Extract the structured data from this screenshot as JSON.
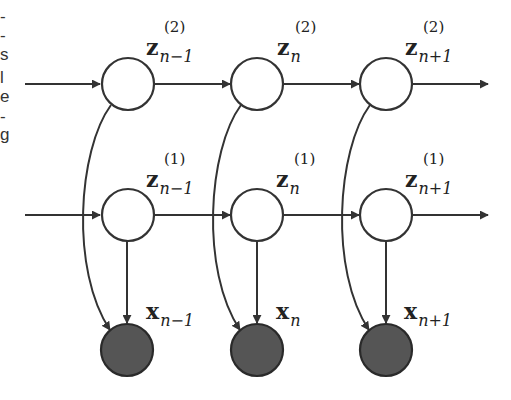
{
  "diagram": {
    "type": "graphical-model",
    "left_margin_fragments": [
      "-",
      "-",
      "s",
      "l",
      "e",
      "-",
      "g"
    ],
    "colors": {
      "stroke": "#333333",
      "latent_fill": "#ffffff",
      "observed_fill": "#555555",
      "background": "#ffffff"
    },
    "nodes": {
      "layer2": [
        {
          "id": "z2_nm1",
          "base": "z",
          "sup": "(2)",
          "sub": "n−1",
          "kind": "latent"
        },
        {
          "id": "z2_n",
          "base": "z",
          "sup": "(2)",
          "sub": "n",
          "kind": "latent"
        },
        {
          "id": "z2_np1",
          "base": "z",
          "sup": "(2)",
          "sub": "n+1",
          "kind": "latent"
        }
      ],
      "layer1": [
        {
          "id": "z1_nm1",
          "base": "z",
          "sup": "(1)",
          "sub": "n−1",
          "kind": "latent"
        },
        {
          "id": "z1_n",
          "base": "z",
          "sup": "(1)",
          "sub": "n",
          "kind": "latent"
        },
        {
          "id": "z1_np1",
          "base": "z",
          "sup": "(1)",
          "sub": "n+1",
          "kind": "latent"
        }
      ],
      "observed": [
        {
          "id": "x_nm1",
          "base": "x",
          "sub": "n−1",
          "kind": "observed"
        },
        {
          "id": "x_n",
          "base": "x",
          "sub": "n",
          "kind": "observed"
        },
        {
          "id": "x_np1",
          "base": "x",
          "sub": "n+1",
          "kind": "observed"
        }
      ]
    },
    "edges": [
      "in → z2_nm1",
      "z2_nm1 → z2_n",
      "z2_n → z2_np1",
      "z2_np1 → out",
      "in → z1_nm1",
      "z1_nm1 → z1_n",
      "z1_n → z1_np1",
      "z1_np1 → out",
      "z1_nm1 → x_nm1",
      "z1_n → x_n",
      "z1_np1 → x_np1",
      "z2_nm1 → x_nm1",
      "z2_n → x_n",
      "z2_np1 → x_np1"
    ]
  }
}
